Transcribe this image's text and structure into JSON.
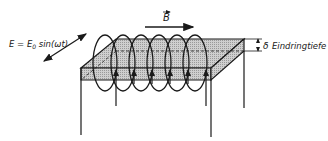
{
  "labels": {
    "e_field": "E = E",
    "e_field_sub": "0",
    "e_field_func": " sin(ωt)",
    "b_field": "B",
    "delta": "δ",
    "penetration_depth": "Eindringtiefe"
  },
  "colors": {
    "ink": "#1a1a1a",
    "slab_fill": "#c4c4c4",
    "background": "#ffffff"
  }
}
